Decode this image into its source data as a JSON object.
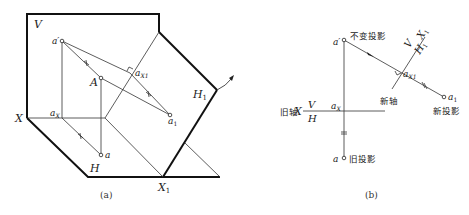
{
  "figure_a": {
    "caption": "(a)",
    "planes": {
      "V": "V",
      "H": "H",
      "H1": "H",
      "H1_sub": "1"
    },
    "axes": {
      "X": "X",
      "X1": "X",
      "X1_sub": "1"
    },
    "points": {
      "a_prime": "a′",
      "A": "A",
      "a": "a",
      "aX": "a",
      "aX_sub": "X",
      "aX1": "a",
      "aX1_sub": "X1",
      "a1": "a",
      "a1_sub": "1"
    }
  },
  "figure_b": {
    "caption": "(b)",
    "old_axis_label": "旧轴",
    "old_axis_X": "X",
    "old_axis_V": "V",
    "old_axis_H": "H",
    "new_axis_label": "新轴",
    "new_axis_V": "V",
    "new_axis_H": "H",
    "new_axis_H_sub": "1",
    "new_axis_X": "X",
    "new_axis_X_sub": "1",
    "unchanged_projection": "不变投影",
    "old_projection": "旧投影",
    "new_projection": "新投影",
    "points": {
      "a_prime": "a′",
      "a": "a",
      "aX": "a",
      "aX_sub": "X",
      "aX1": "a",
      "aX1_sub": "X1",
      "a1": "a",
      "a1_sub": "1"
    }
  }
}
